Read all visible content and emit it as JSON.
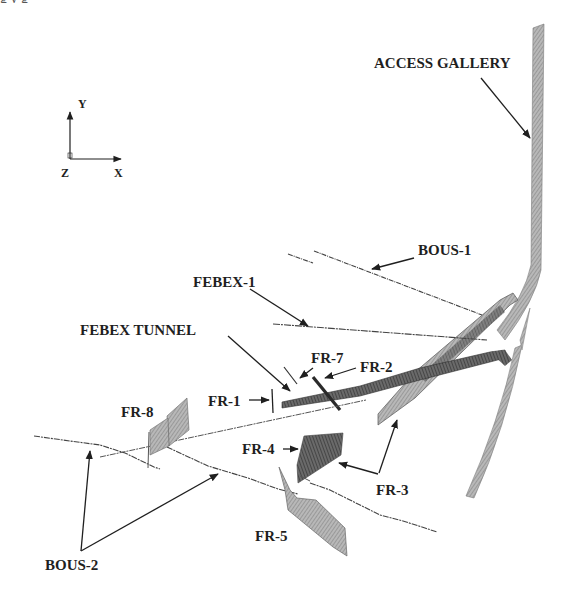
{
  "figure": {
    "caption_fragment": "g  y  g",
    "colors": {
      "ink": "#1f1f1f",
      "mesh": "#8c8c8c",
      "mesh_dark": "#4a4a4a",
      "mesh_light": "#b5b5b5",
      "background": "#ffffff"
    }
  },
  "axes": {
    "y_label": "Y",
    "x_label": "X",
    "z_label": "Z"
  },
  "labels": {
    "access_gallery": "ACCESS GALLERY",
    "bous_1": "BOUS-1",
    "febex_1": "FEBEX-1",
    "febex_tunnel": "FEBEX TUNNEL",
    "fr_7": "FR-7",
    "fr_2": "FR-2",
    "fr_1": "FR-1",
    "fr_8": "FR-8",
    "fr_4": "FR-4",
    "fr_3": "FR-3",
    "fr_5": "FR-5",
    "bous_2": "BOUS-2"
  }
}
